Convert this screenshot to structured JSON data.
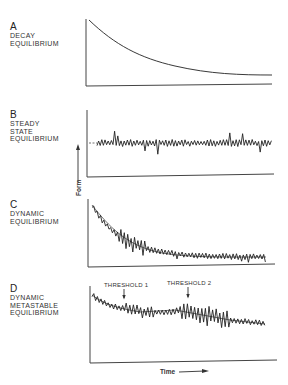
{
  "panels": [
    {
      "letter": "A",
      "lines": [
        "DECAY",
        "EQUILIBRIUM"
      ]
    },
    {
      "letter": "B",
      "lines": [
        "STEADY",
        "STATE",
        "EQUILIBRIUM"
      ]
    },
    {
      "letter": "C",
      "lines": [
        "DYNAMIC",
        "EQUILIBRIUM"
      ]
    },
    {
      "letter": "D",
      "lines": [
        "DYNAMIC",
        "METASTABLE",
        "EQUILIBRIUM"
      ]
    }
  ],
  "axes": {
    "y_label": "Form",
    "x_label": "Time"
  },
  "annotations": {
    "threshold_1": "THRESHOLD 1",
    "threshold_2": "THRESHOLD 2"
  }
}
